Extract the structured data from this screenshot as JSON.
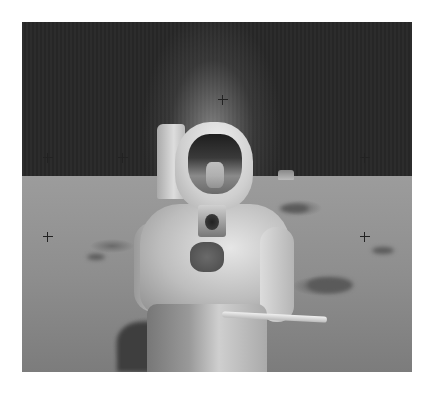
{
  "image": {
    "subject": "Astronaut on lunar surface holding camera",
    "description": "Black-and-white photograph of a suited astronaut with reflective visor standing on the Moon; black sky, grey regolith, lunar module in the distance, reseau crosshairs visible",
    "background_color": "#ffffff",
    "photo_bounds": {
      "x": 22,
      "y": 22,
      "width": 390,
      "height": 350
    },
    "horizon_y": 176,
    "colors": {
      "sky": "#2a2a2a",
      "ground": "#8e8e8e",
      "suit": "#d8d8d8",
      "visor": "#2e2e2e"
    },
    "crosshairs": [
      {
        "x": 43,
        "y": 153
      },
      {
        "x": 118,
        "y": 73
      },
      {
        "x": 195,
        "y": 73
      },
      {
        "x": 268,
        "y": 73
      },
      {
        "x": 343,
        "y": 153
      },
      {
        "x": 43,
        "y": 232
      },
      {
        "x": 343,
        "y": 232
      },
      {
        "x": 268,
        "y": 232
      }
    ]
  }
}
